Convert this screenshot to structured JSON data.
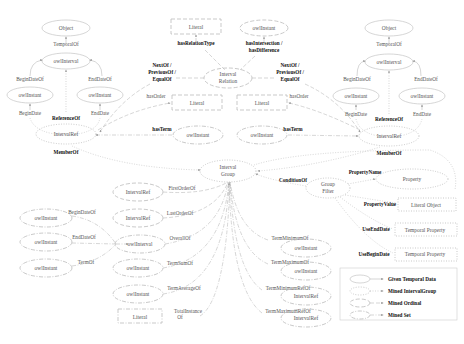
{
  "nodes": {
    "left_object": "Object",
    "left_interval": "owlInterval",
    "left_begin_instant": "owlInstant",
    "left_end_instant": "owlInstant",
    "left_intervalref": "IntervalRef",
    "right_object": "Object",
    "right_interval": "owlInterval",
    "right_begin_instant": "owlInstant",
    "right_end_instant": "owlInstant",
    "right_intervalref": "IntervalRef",
    "rel_literal": "Literal",
    "rel_instant": "owlInstant",
    "interval_relation_1": "Interval",
    "interval_relation_2": "Relation",
    "order_literal_left": "Literal",
    "order_literal_right": "Literal",
    "term_instant_left": "owlInstant",
    "term_instant_right": "owlInstant",
    "interval_group_1": "Interval",
    "interval_group_2": "Group",
    "group_filter_1": "Group",
    "group_filter_2": "Filter",
    "property": "Property",
    "literal_object": "Literal Object",
    "temporal_property_1": "Temporal Property",
    "temporal_property_2": "Temporal Property",
    "set_instant_1": "owlInstant",
    "set_instant_2": "owlInstant",
    "set_instant_3": "owlInstant",
    "first_intervalref": "IntervalRef",
    "last_intervalref": "IntervalRef",
    "overall_interval": "owlInterval",
    "termsum_instant": "owlInstant",
    "termavg_instant": "owlInstant",
    "total_literal": "Literal",
    "termmin_instant": "owlInstant",
    "termmax_instant": "owlInstant",
    "termminref_intervalref": "IntervalRef",
    "termmaxref_intervalref": "IntervalRef"
  },
  "edges": {
    "temporal_of_left": "TemporalOf",
    "begin_date_of_left": "BeginDateOf",
    "end_date_of_left": "EndDateOf",
    "begin_date_left": "BeginDate",
    "end_date_left": "EndDate",
    "reference_of_left": "ReferenceOf",
    "member_of_left": "MemberOf",
    "temporal_of_right": "TemporalOf",
    "begin_date_of_right": "BeginDateOf",
    "end_date_of_right": "EndDateOf",
    "begin_date_right": "BeginDate",
    "end_date_right": "EndDate",
    "reference_of_right": "ReferenceOf",
    "member_of_right": "MemberOf",
    "has_relation_type": "hasRelationType",
    "has_intersection_1": "hasIntersection /",
    "has_intersection_2": "hasDifference",
    "next_of_left_1": "NextOf /",
    "next_of_left_2": "PreviousOf /",
    "next_of_left_3": "EqualOf",
    "next_of_right_1": "NextOf /",
    "next_of_right_2": "PreviousOf /",
    "next_of_right_3": "EqualOf",
    "has_order_left": "hasOrder",
    "has_order_right": "hasOrder",
    "has_term_left": "hasTerm",
    "has_term_right": "hasTerm",
    "condition_of": "ConditionOf",
    "property_name": "PropertyName",
    "property_value": "PropertyValue",
    "use_end_date": "UseEndDate",
    "use_begin_date": "UseBeginDate",
    "set_begin_date_of": "BeginDateOf",
    "set_end_date_of": "EndDateOf",
    "set_term_of": "TermOf",
    "first_order_of": "FirstOrderOf",
    "last_order_of": "LastOrderOf",
    "overall_of": "OverallOf",
    "term_sum_of": "TermSumOf",
    "term_average_of": "TermAverageOf",
    "total_instance_1": "TotalInstance",
    "total_instance_2": "Of",
    "term_minimum_of": "TermMinimumOf",
    "term_maximum_of": "TermMaximumOf",
    "term_minimum_ref_of": "TermMinimumRefOf",
    "term_maximum_ref_of": "TermMaximumRefOf"
  },
  "legend": {
    "given": "Given Temporal Data",
    "group": "Mined IntervalGroup",
    "ordinal": "Mined Ordinal",
    "set": "Mined Set"
  }
}
